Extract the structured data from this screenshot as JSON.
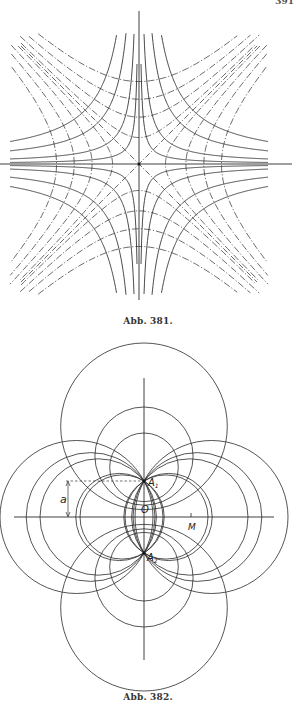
{
  "page": {
    "page_number": "391"
  },
  "figure_381": {
    "caption": "Abb. 381.",
    "center": [
      139,
      164
    ],
    "axes": {
      "horizontal": {
        "x1": 0,
        "x2": 292,
        "y": 164
      },
      "vertical": {
        "x": 139,
        "y1": 11,
        "y2": 300
      }
    },
    "solid_hyperbolas_xy_c": [
      200,
      650,
      1700,
      2900
    ],
    "dashdot_hyperbolas_x2_minus_y2_c": [
      700,
      2200,
      4200,
      6800
    ],
    "extent": {
      "xmin": 10,
      "xmax": 268,
      "ymin": 33,
      "ymax": 295
    },
    "line_color": "#2a2a2a"
  },
  "figure_382": {
    "caption": "Abb. 382.",
    "labels": {
      "A1": "A",
      "A1_sub": "1",
      "A2": "A",
      "A2_sub": "2",
      "O": "O",
      "M": "M",
      "a": "a"
    },
    "O": [
      144,
      517
    ],
    "A1": [
      144,
      481
    ],
    "A2": [
      144,
      553
    ],
    "a_distance": 36,
    "axes": {
      "horizontal": {
        "x1": 14,
        "x2": 274,
        "y": 517
      },
      "vertical": {
        "x": 144,
        "y1": 378,
        "y2": 660
      }
    },
    "circles_through_A1_A2": [
      {
        "cx": 76.5,
        "r": 76.5
      },
      {
        "cx": 98.2,
        "r": 58.2
      },
      {
        "cx": 122.1,
        "r": 42.1
      },
      {
        "cx": 211.5,
        "r": 76.5
      },
      {
        "cx": 189.8,
        "r": 58.2
      },
      {
        "cx": 165.9,
        "r": 42.1
      },
      {
        "cx": 168.6,
        "r": 43.6
      },
      {
        "cx": 119.4,
        "r": 43.6
      },
      {
        "cx": 197.4,
        "r": 64.4
      },
      {
        "cx": 90.6,
        "r": 64.4
      }
    ],
    "apollonian_circles": [
      {
        "cy": 426.3,
        "r": 83.3
      },
      {
        "cy": 456.1,
        "r": 49.1
      },
      {
        "cy": 467.3,
        "r": 34.3
      },
      {
        "cy": 607.7,
        "r": 83.3
      },
      {
        "cy": 577.9,
        "r": 49.1
      },
      {
        "cy": 566.7,
        "r": 34.3
      }
    ],
    "line_color": "#2a2a2a"
  }
}
